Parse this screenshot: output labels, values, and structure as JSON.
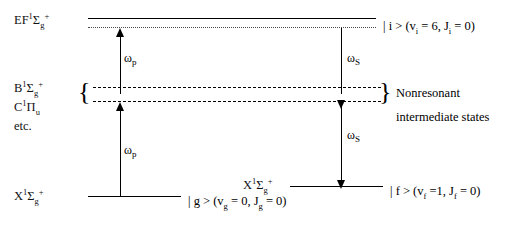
{
  "diagram": {
    "states": {
      "upper": {
        "name": "EF-state-label",
        "term_main": "EF",
        "term_sup": "1",
        "term_sigma": "Σ",
        "term_sub": "g",
        "term_charge": "+"
      },
      "intermediate_b": {
        "term_main": "B",
        "term_sup": "1",
        "term_sigma": "Σ",
        "term_sub": "g",
        "term_charge": "+"
      },
      "intermediate_c": {
        "term_main": "C",
        "term_sup": "1",
        "term_pi": "Π",
        "term_sub": "u"
      },
      "intermediate_etc": "etc.",
      "ground": {
        "term_main": "X",
        "term_sup": "1",
        "term_sigma": "Σ",
        "term_sub": "g",
        "term_charge": "+"
      },
      "final": {
        "term_main": "X",
        "term_sup": "1",
        "term_sigma": "Σ",
        "term_sub": "g",
        "term_charge": "+"
      }
    },
    "kets": {
      "initial": {
        "bracket_open": "| i > (v",
        "sub_v": "i",
        "eq_v": " = 6, J",
        "sub_j": "i",
        "eq_j": " = 0)"
      },
      "ground": {
        "bracket_open": "| g > (v",
        "sub_v": "g",
        "eq_v": " = 0, J",
        "sub_j": "g",
        "eq_j": " = 0)"
      },
      "final": {
        "bracket_open": "| f > (v",
        "sub_v": "f",
        "eq_v": " =1, J",
        "sub_j": "f",
        "eq_j": " = 0)"
      }
    },
    "arrows": {
      "pump_upper": {
        "symbol": "ω",
        "subscript": "p"
      },
      "pump_lower": {
        "symbol": "ω",
        "subscript": "p"
      },
      "stokes_upper": {
        "symbol": "ω",
        "subscript": "S"
      },
      "stokes_lower": {
        "symbol": "ω",
        "subscript": "S"
      }
    },
    "braces": {
      "left": "{",
      "right": "}"
    },
    "annotation": {
      "line1": "Nonresonant",
      "line2": "intermediate states"
    },
    "colors": {
      "ink": "#000000",
      "background": "#ffffff",
      "dotted_line": "#4a4a4a"
    }
  }
}
